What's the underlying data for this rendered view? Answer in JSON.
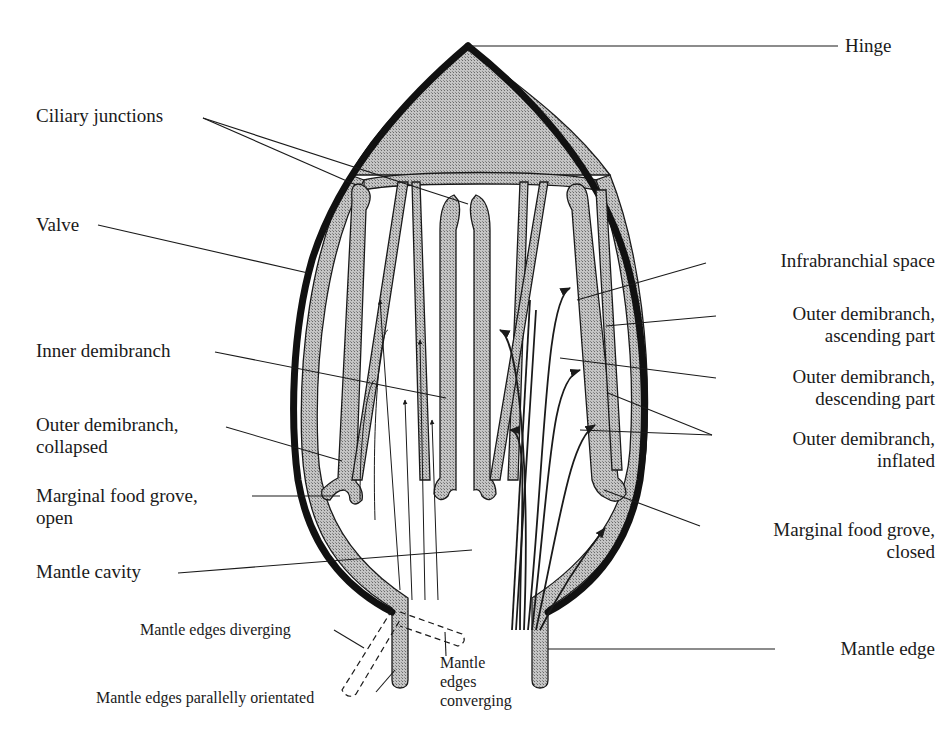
{
  "diagram": {
    "labels": {
      "hinge": "Hinge",
      "ciliary_junctions": "Ciliary junctions",
      "valve": "Valve",
      "infrabranchial_space": "Infrabranchial space",
      "outer_ascending_1": "Outer demibranch,",
      "outer_ascending_2": "ascending part",
      "inner_demibranch": "Inner demibranch",
      "outer_descending_1": "Outer demibranch,",
      "outer_descending_2": "descending part",
      "outer_collapsed_1": "Outer demibranch,",
      "outer_collapsed_2": "collapsed",
      "outer_inflated_1": "Outer demibranch,",
      "outer_inflated_2": "inflated",
      "food_groove_open_1": "Marginal food grove,",
      "food_groove_open_2": "open",
      "food_groove_closed_1": "Marginal food grove,",
      "food_groove_closed_2": "closed",
      "mantle_cavity": "Mantle cavity",
      "mantle_edges_diverging": "Mantle edges diverging",
      "mantle_edge": "Mantle edge",
      "mantle_edges_parallel": "Mantle edges parallelly orientated",
      "mantle_converging_1": "Mantle",
      "mantle_converging_2": "edges",
      "mantle_converging_3": "converging"
    },
    "colors": {
      "ink": "#1a1a1a",
      "tissue_fill": "#a8a8a8",
      "background": "#ffffff"
    }
  }
}
